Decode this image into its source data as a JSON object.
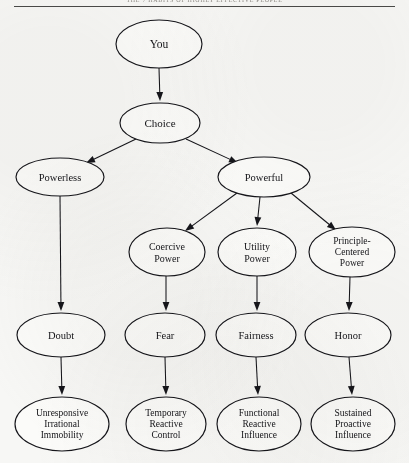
{
  "page": {
    "running_head": "THE 7 HABITS OF HIGHLY EFFECTIVE PEOPLE",
    "background_color": "#f7f7f5",
    "ink_color": "#15151a",
    "width": 409,
    "height": 463
  },
  "diagram": {
    "type": "flowchart",
    "node_shape": "ellipse",
    "nodes": [
      {
        "id": "you",
        "label": "You",
        "lines": [
          "You"
        ],
        "cx": 159,
        "cy": 44,
        "rx": 43,
        "ry": 24,
        "font_size": 11.5,
        "row": 0
      },
      {
        "id": "choice",
        "label": "Choice",
        "lines": [
          "Choice"
        ],
        "cx": 160,
        "cy": 123,
        "rx": 40,
        "ry": 20,
        "font_size": 11,
        "row": 1
      },
      {
        "id": "powerless",
        "label": "Powerless",
        "lines": [
          "Powerless"
        ],
        "cx": 60,
        "cy": 177,
        "rx": 44,
        "ry": 19,
        "font_size": 10.5,
        "row": 2
      },
      {
        "id": "powerful",
        "label": "Powerful",
        "lines": [
          "Powerful"
        ],
        "cx": 264,
        "cy": 177,
        "rx": 46,
        "ry": 20,
        "font_size": 10.5,
        "row": 2
      },
      {
        "id": "coercive",
        "label": "Coercive Power",
        "lines": [
          "Coercive",
          "Power"
        ],
        "cx": 167,
        "cy": 252,
        "rx": 38,
        "ry": 24,
        "font_size": 10,
        "row": 3
      },
      {
        "id": "utility",
        "label": "Utility Power",
        "lines": [
          "Utility",
          "Power"
        ],
        "cx": 257,
        "cy": 252,
        "rx": 39,
        "ry": 24,
        "font_size": 10,
        "row": 3
      },
      {
        "id": "principle",
        "label": "Principle-Centered Power",
        "lines": [
          "Principle-",
          "Centered",
          "Power"
        ],
        "cx": 352,
        "cy": 252,
        "rx": 43,
        "ry": 25,
        "font_size": 9.5,
        "row": 3
      },
      {
        "id": "doubt",
        "label": "Doubt",
        "lines": [
          "Doubt"
        ],
        "cx": 61,
        "cy": 335,
        "rx": 44,
        "ry": 22,
        "font_size": 10.5,
        "row": 4
      },
      {
        "id": "fear",
        "label": "Fear",
        "lines": [
          "Fear"
        ],
        "cx": 165,
        "cy": 335,
        "rx": 40,
        "ry": 22,
        "font_size": 10.5,
        "row": 4
      },
      {
        "id": "fairness",
        "label": "Fairness",
        "lines": [
          "Fairness"
        ],
        "cx": 256,
        "cy": 335,
        "rx": 40,
        "ry": 22,
        "font_size": 10.5,
        "row": 4
      },
      {
        "id": "honor",
        "label": "Honor",
        "lines": [
          "Honor"
        ],
        "cx": 348,
        "cy": 335,
        "rx": 43,
        "ry": 22,
        "font_size": 10.5,
        "row": 4
      },
      {
        "id": "immobility",
        "label": "Unresponsive Irrational Immobility",
        "lines": [
          "Unresponsive",
          "Irrational",
          "Immobility"
        ],
        "cx": 62,
        "cy": 424,
        "rx": 47,
        "ry": 27,
        "font_size": 9.5,
        "row": 5
      },
      {
        "id": "control",
        "label": "Temporary Reactive Control",
        "lines": [
          "Temporary",
          "Reactive",
          "Control"
        ],
        "cx": 166,
        "cy": 424,
        "rx": 40,
        "ry": 27,
        "font_size": 9.5,
        "row": 5
      },
      {
        "id": "funcinf",
        "label": "Functional Reactive Influence",
        "lines": [
          "Functional",
          "Reactive",
          "Influence"
        ],
        "cx": 259,
        "cy": 424,
        "rx": 42,
        "ry": 27,
        "font_size": 9.5,
        "row": 5
      },
      {
        "id": "sustinf",
        "label": "Sustained Proactive Influence",
        "lines": [
          "Sustained",
          "Proactive",
          "Influence"
        ],
        "cx": 353,
        "cy": 424,
        "rx": 42,
        "ry": 27,
        "font_size": 9.5,
        "row": 5
      }
    ],
    "edges": [
      {
        "from": "you",
        "to": "choice",
        "x1": 159,
        "y1": 68,
        "x2": 160,
        "y2": 101
      },
      {
        "from": "choice",
        "to": "powerless",
        "x1": 136,
        "y1": 139,
        "x2": 86,
        "y2": 163
      },
      {
        "from": "choice",
        "to": "powerful",
        "x1": 186,
        "y1": 139,
        "x2": 238,
        "y2": 163
      },
      {
        "from": "powerless",
        "to": "doubt",
        "x1": 60,
        "y1": 196,
        "x2": 61,
        "y2": 311
      },
      {
        "from": "powerful",
        "to": "coercive",
        "x1": 237,
        "y1": 193,
        "x2": 185,
        "y2": 231
      },
      {
        "from": "powerful",
        "to": "utility",
        "x1": 260,
        "y1": 197,
        "x2": 257,
        "y2": 226
      },
      {
        "from": "powerful",
        "to": "principle",
        "x1": 291,
        "y1": 193,
        "x2": 336,
        "y2": 230
      },
      {
        "from": "coercive",
        "to": "fear",
        "x1": 166,
        "y1": 276,
        "x2": 166,
        "y2": 311
      },
      {
        "from": "utility",
        "to": "fairness",
        "x1": 257,
        "y1": 276,
        "x2": 257,
        "y2": 311
      },
      {
        "from": "principle",
        "to": "honor",
        "x1": 350,
        "y1": 277,
        "x2": 349,
        "y2": 311
      },
      {
        "from": "doubt",
        "to": "immobility",
        "x1": 61,
        "y1": 357,
        "x2": 62,
        "y2": 395
      },
      {
        "from": "fear",
        "to": "control",
        "x1": 165,
        "y1": 357,
        "x2": 166,
        "y2": 395
      },
      {
        "from": "fairness",
        "to": "funcinf",
        "x1": 256,
        "y1": 357,
        "x2": 258,
        "y2": 395
      },
      {
        "from": "honor",
        "to": "sustinf",
        "x1": 349,
        "y1": 357,
        "x2": 352,
        "y2": 395
      }
    ]
  }
}
